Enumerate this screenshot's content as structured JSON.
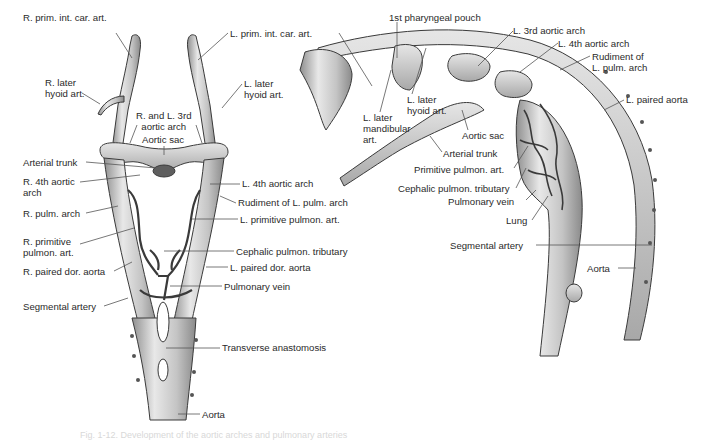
{
  "figure": {
    "caption": "Fig. 1-12. Development of the aortic arches and pulmonary arteries",
    "colors": {
      "vessel_fill": "#c9c9c9",
      "vessel_light": "#e9e9e9",
      "vessel_dark": "#8a8a8a",
      "outline": "#3a3a3a",
      "leader_line": "#555555",
      "label_text": "#2a2a2a",
      "sac_dark": "#5e5e5e"
    }
  },
  "left_diagram": {
    "view": "ventral",
    "labels": [
      {
        "id": "r-prim-int-car-art",
        "text": "R. prim. int. car. art.",
        "x": 23,
        "y": 28
      },
      {
        "id": "r-later-hyoid-art",
        "text": "R. later\nhyoid art.",
        "x": 45,
        "y": 77
      },
      {
        "id": "r-and-l-3rd-aortic-arch",
        "text": "R. and L. 3rd\n  aortic arch",
        "x": 136,
        "y": 109
      },
      {
        "id": "aortic-sac-left",
        "text": "Aortic sac",
        "x": 142,
        "y": 134
      },
      {
        "id": "arterial-trunk-left",
        "text": "Arterial trunk",
        "x": 23,
        "y": 157
      },
      {
        "id": "r-4th-aortic-arch",
        "text": "R. 4th aortic\narch",
        "x": 23,
        "y": 176
      },
      {
        "id": "l-4th-aortic-arch",
        "text": "L. 4th aortic arch",
        "x": 242,
        "y": 180
      },
      {
        "id": "rudiment-l-pulm-arch-left",
        "text": "Rudiment of L. pulm. arch",
        "x": 238,
        "y": 199
      },
      {
        "id": "r-pulm-arch",
        "text": "R. pulm. arch",
        "x": 23,
        "y": 208
      },
      {
        "id": "l-primitive-pulmon-art",
        "text": "L. primitive pulmon. art.",
        "x": 240,
        "y": 214
      },
      {
        "id": "r-primitive-pulmon-art",
        "text": "R. primitive\npulmon. art.",
        "x": 23,
        "y": 236
      },
      {
        "id": "cephalic-pulmon-tributary-left",
        "text": "Cephalic pulmon. tributary",
        "x": 236,
        "y": 246
      },
      {
        "id": "l-paired-dor-aorta",
        "text": "L. paired dor. aorta",
        "x": 230,
        "y": 262
      },
      {
        "id": "r-paired-dor-aorta",
        "text": "R. paired dor. aorta",
        "x": 23,
        "y": 266
      },
      {
        "id": "pulmonary-vein-left",
        "text": "Pulmonary vein",
        "x": 224,
        "y": 281
      },
      {
        "id": "segmental-artery-left",
        "text": "Segmental artery",
        "x": 23,
        "y": 301
      },
      {
        "id": "transverse-anastomosis",
        "text": "Transverse anastomosis",
        "x": 222,
        "y": 343
      },
      {
        "id": "aorta-left",
        "text": "Aorta",
        "x": 202,
        "y": 409
      }
    ]
  },
  "right_diagram": {
    "view": "lateral",
    "labels": [
      {
        "id": "l-prim-int-car-art",
        "text": "L. prim. int. car. art.",
        "x": 230,
        "y": 28
      },
      {
        "id": "l-later-hyoid-art-left",
        "text": "L. later\nhyoid art.",
        "x": 244,
        "y": 77
      },
      {
        "id": "first-pharyngeal-pouch",
        "text": "1st pharyngeal pouch",
        "x": 389,
        "y": 14
      },
      {
        "id": "l-3rd-aortic-arch",
        "text": "L. 3rd aortic arch",
        "x": 513,
        "y": 26
      },
      {
        "id": "l-4th-aortic-arch-right",
        "text": "L. 4th aortic arch",
        "x": 558,
        "y": 38
      },
      {
        "id": "rudiment-l-pulm-arch-right",
        "text": "Rudiment of\nL. pulm. arch",
        "x": 592,
        "y": 51
      },
      {
        "id": "l-paired-aorta",
        "text": "L. paired aorta",
        "x": 626,
        "y": 95
      },
      {
        "id": "l-later-mandibular-art",
        "text": "L. later\nmandibular\nart.",
        "x": 363,
        "y": 112
      },
      {
        "id": "l-later-hyoid-art-right",
        "text": "L. later\nhyoid art.",
        "x": 407,
        "y": 94
      },
      {
        "id": "aortic-sac-right",
        "text": "Aortic sac",
        "x": 462,
        "y": 132
      },
      {
        "id": "arterial-trunk-right",
        "text": "Arterial trunk",
        "x": 443,
        "y": 148
      },
      {
        "id": "primitive-pulmon-art",
        "text": "Primitive pulmon. art.",
        "x": 414,
        "y": 164
      },
      {
        "id": "cephalic-pulmon-tributary-right",
        "text": "Cephalic pulmon. tributary",
        "x": 398,
        "y": 184
      },
      {
        "id": "pulmonary-vein-right",
        "text": "Pulmonary vein",
        "x": 448,
        "y": 196
      },
      {
        "id": "lung",
        "text": "Lung",
        "x": 506,
        "y": 216
      },
      {
        "id": "segmental-artery-right",
        "text": "Segmental artery",
        "x": 450,
        "y": 240
      },
      {
        "id": "aorta-right",
        "text": "Aorta",
        "x": 587,
        "y": 263
      }
    ]
  }
}
